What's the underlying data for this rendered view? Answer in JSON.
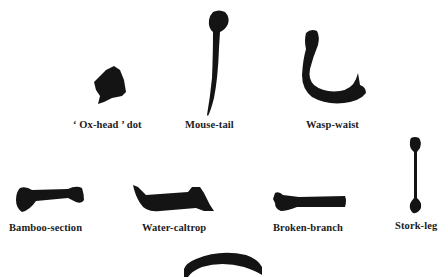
{
  "figure": {
    "ink_color": "#141414",
    "background": "#ffffff",
    "strokes": [
      {
        "id": "ox-head-dot",
        "label": "‘ Ox-head ’ dot"
      },
      {
        "id": "mouse-tail",
        "label": "Mouse-tail"
      },
      {
        "id": "wasp-waist",
        "label": "Wasp-waist"
      },
      {
        "id": "bamboo-section",
        "label": "Bamboo-section"
      },
      {
        "id": "water-caltrop",
        "label": "Water-caltrop"
      },
      {
        "id": "broken-branch",
        "label": "Broken-branch"
      },
      {
        "id": "stork-leg",
        "label": "Stork-leg"
      },
      {
        "id": "arc-stroke",
        "label": ""
      }
    ]
  }
}
